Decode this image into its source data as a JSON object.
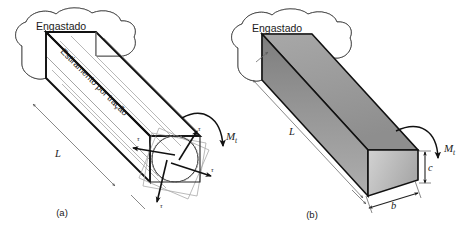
{
  "figure": {
    "background_color": "#ffffff",
    "ink_color": "#111111",
    "width": 476,
    "height": 228
  },
  "panel_a": {
    "caption": "(a)",
    "wall_label": "Engastado",
    "stretch_label": "Estiramento por tração",
    "length_label": "L",
    "moment_label": "M",
    "moment_subscript": "t",
    "shear_labels": [
      "τ",
      "τ",
      "τ",
      "τ"
    ],
    "section_shape": "square-with-inscribed-circle",
    "bar_style": "wireframe"
  },
  "panel_b": {
    "caption": "(b)",
    "wall_label": "Engastado",
    "length_label": "L",
    "moment_label": "M",
    "moment_subscript": "t",
    "width_label": "b",
    "height_label": "c",
    "section_shape": "rectangular",
    "bar_style": "solid-shaded",
    "face_colors": {
      "top": "#9a9a9a",
      "side": "#8a8a8a",
      "end": "#c2c2c2"
    }
  }
}
